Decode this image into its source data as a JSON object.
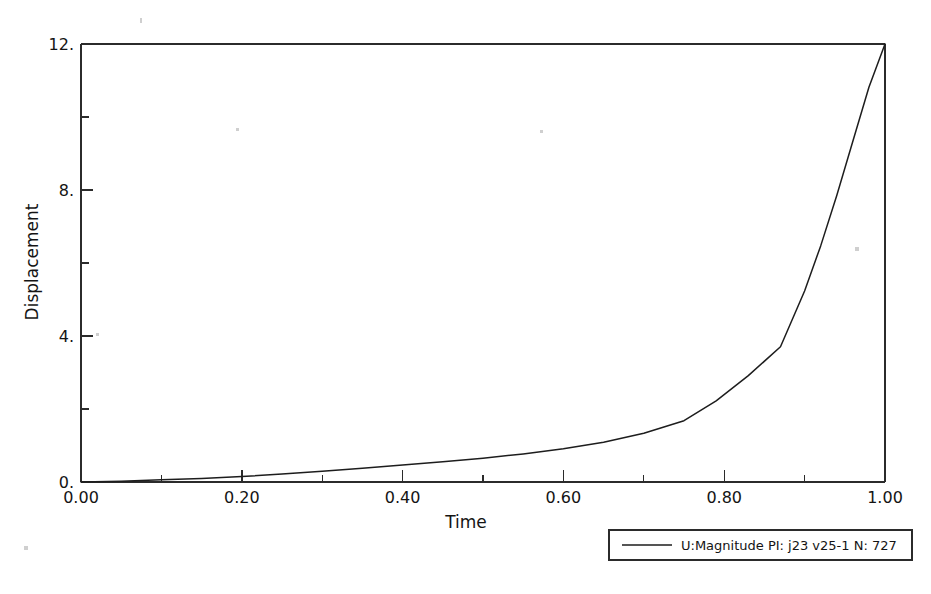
{
  "chart_data": {
    "type": "line",
    "title": "",
    "xlabel": "Time",
    "ylabel": "Displacement",
    "xlim": [
      0.0,
      1.0
    ],
    "ylim": [
      0.0,
      12.15
    ],
    "grid": false,
    "legend_position": "bottom-right-outside",
    "x_tick_labels": [
      "0.00",
      "0.20",
      "0.40",
      "0.60",
      "0.80",
      "1.00"
    ],
    "x_tick_values": [
      0.0,
      0.2,
      0.4,
      0.6,
      0.8,
      1.0
    ],
    "x_minor_tick_values": [
      0.1,
      0.3,
      0.5,
      0.7,
      0.9
    ],
    "y_tick_labels": [
      "0.",
      "4.",
      "8.",
      "12."
    ],
    "y_tick_values": [
      0,
      4,
      8,
      12
    ],
    "y_minor_tick_values": [
      2,
      6,
      10
    ],
    "series": [
      {
        "name": "U:Magnitude PI: j23 v25-1 N: 727",
        "color": "#1d1d1d",
        "x": [
          0.0,
          0.05,
          0.1,
          0.15,
          0.2,
          0.25,
          0.3,
          0.35,
          0.4,
          0.45,
          0.5,
          0.55,
          0.6,
          0.65,
          0.7,
          0.75,
          0.79,
          0.83,
          0.87,
          0.9,
          0.92,
          0.94,
          0.96,
          0.98,
          1.0
        ],
        "y": [
          0.0,
          0.02,
          0.06,
          0.1,
          0.15,
          0.22,
          0.3,
          0.38,
          0.47,
          0.56,
          0.66,
          0.78,
          0.92,
          1.1,
          1.35,
          1.7,
          2.25,
          2.95,
          3.75,
          5.3,
          6.55,
          7.95,
          9.45,
          10.95,
          12.15
        ]
      }
    ]
  },
  "legend": {
    "entries": [
      {
        "label": "U:Magnitude PI: j23 v25-1 N: 727",
        "color": "#1d1d1d"
      }
    ]
  },
  "axes": {
    "x_title": "Time",
    "y_title": "Displacement"
  },
  "colors": {
    "curve": "#1d1d1d",
    "axis": "#2b2b2b",
    "background": "#ffffff",
    "text": "#141414"
  }
}
